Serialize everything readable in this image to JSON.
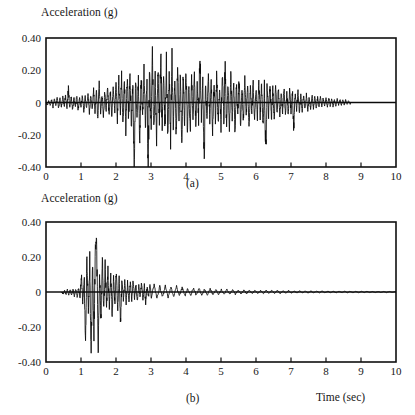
{
  "figure": {
    "name": "earthquake-acceleration-time-histories",
    "x_axis_title": "Time (sec)"
  },
  "chart_data": [
    {
      "id": "a",
      "type": "line",
      "title": "Acceleration (g)",
      "caption": "(a)",
      "xlabel": "",
      "ylabel": "Acceleration (g)",
      "xlim": [
        0,
        10
      ],
      "ylim": [
        -0.4,
        0.4
      ],
      "xticks": [
        "0",
        "1",
        "2",
        "3",
        "4",
        "5",
        "6",
        "7",
        "8",
        "9",
        "10"
      ],
      "xtick_values": [
        0,
        1,
        2,
        3,
        4,
        5,
        6,
        7,
        8,
        9,
        10
      ],
      "yticks": [
        "0.40",
        "0.20",
        "0",
        "-0.20",
        "-0.40"
      ],
      "ytick_values": [
        0.4,
        0.2,
        0,
        -0.2,
        -0.4
      ],
      "grid": false,
      "legend": "none",
      "series_name": "ground acceleration record (a)",
      "peak_positive": 0.33,
      "peak_positive_time": 3.05,
      "peak_negative": -0.4,
      "peak_negative_time": 2.92,
      "record_end_time": 8.7,
      "description": "Broad-band strong motion accelerogram with energetic shaking from about 1.5 s to 7.5 s and a long coda decaying to zero near 8.7 s",
      "x": [
        0.0,
        0.04,
        0.08,
        0.12,
        0.16,
        0.2,
        0.24,
        0.28,
        0.32,
        0.36,
        0.4,
        0.44,
        0.48,
        0.52,
        0.56,
        0.6,
        0.64,
        0.68,
        0.72,
        0.76,
        0.8,
        0.84,
        0.88,
        0.92,
        0.96,
        1.0,
        1.04,
        1.08,
        1.12,
        1.16,
        1.2,
        1.24,
        1.28,
        1.32,
        1.36,
        1.4,
        1.44,
        1.48,
        1.52,
        1.56,
        1.6,
        1.64,
        1.68,
        1.72,
        1.76,
        1.8,
        1.84,
        1.88,
        1.92,
        1.96,
        2.0,
        2.04,
        2.08,
        2.12,
        2.16,
        2.2,
        2.24,
        2.28,
        2.32,
        2.36,
        2.4,
        2.44,
        2.48,
        2.52,
        2.56,
        2.6,
        2.64,
        2.68,
        2.72,
        2.76,
        2.8,
        2.84,
        2.88,
        2.92,
        2.96,
        3.0,
        3.04,
        3.08,
        3.12,
        3.16,
        3.2,
        3.24,
        3.28,
        3.32,
        3.36,
        3.4,
        3.44,
        3.48,
        3.52,
        3.56,
        3.6,
        3.64,
        3.68,
        3.72,
        3.76,
        3.8,
        3.84,
        3.88,
        3.92,
        3.96,
        4.0,
        4.04,
        4.08,
        4.12,
        4.16,
        4.2,
        4.24,
        4.28,
        4.32,
        4.36,
        4.4,
        4.44,
        4.48,
        4.52,
        4.56,
        4.6,
        4.64,
        4.68,
        4.72,
        4.76,
        4.8,
        4.84,
        4.88,
        4.92,
        4.96,
        5.0,
        5.04,
        5.08,
        5.12,
        5.16,
        5.2,
        5.24,
        5.28,
        5.32,
        5.36,
        5.4,
        5.44,
        5.48,
        5.52,
        5.56,
        5.6,
        5.64,
        5.68,
        5.72,
        5.76,
        5.8,
        5.84,
        5.88,
        5.92,
        5.96,
        6.0,
        6.04,
        6.08,
        6.12,
        6.16,
        6.2,
        6.24,
        6.28,
        6.32,
        6.36,
        6.4,
        6.44,
        6.48,
        6.52,
        6.56,
        6.6,
        6.64,
        6.68,
        6.72,
        6.76,
        6.8,
        6.84,
        6.88,
        6.92,
        6.96,
        7.0,
        7.04,
        7.08,
        7.12,
        7.16,
        7.2,
        7.24,
        7.28,
        7.32,
        7.36,
        7.4,
        7.44,
        7.48,
        7.52,
        7.56,
        7.6,
        7.64,
        7.68,
        7.72,
        7.76,
        7.8,
        7.84,
        7.88,
        7.92,
        7.96,
        8.0,
        8.04,
        8.08,
        8.12,
        8.16,
        8.2,
        8.24,
        8.28,
        8.32,
        8.36,
        8.4,
        8.44,
        8.48,
        8.52,
        8.56,
        8.6,
        8.64,
        8.7
      ],
      "y": [
        0.0,
        -0.015,
        0.012,
        -0.022,
        0.018,
        -0.028,
        0.02,
        -0.015,
        0.03,
        -0.035,
        0.025,
        -0.03,
        0.038,
        -0.025,
        0.045,
        -0.04,
        0.085,
        -0.038,
        0.035,
        -0.048,
        0.03,
        -0.032,
        0.042,
        -0.05,
        0.028,
        -0.03,
        0.045,
        -0.055,
        0.035,
        -0.04,
        0.05,
        -0.06,
        0.042,
        -0.038,
        0.075,
        -0.07,
        0.06,
        -0.105,
        0.115,
        -0.06,
        0.055,
        -0.085,
        0.07,
        -0.06,
        0.09,
        -0.075,
        0.065,
        -0.095,
        0.105,
        -0.07,
        0.12,
        -0.1,
        0.145,
        -0.085,
        0.175,
        -0.12,
        0.13,
        -0.18,
        0.155,
        -0.1,
        0.21,
        -0.15,
        0.13,
        -0.375,
        0.165,
        -0.11,
        0.14,
        -0.23,
        0.175,
        -0.125,
        0.205,
        -0.16,
        0.12,
        -0.395,
        0.185,
        -0.15,
        0.335,
        -0.19,
        0.15,
        -0.24,
        0.225,
        -0.13,
        0.29,
        -0.175,
        0.2,
        -0.145,
        0.26,
        -0.21,
        0.18,
        -0.25,
        0.305,
        -0.16,
        0.145,
        -0.195,
        0.225,
        -0.14,
        0.175,
        -0.245,
        0.19,
        -0.12,
        0.215,
        -0.165,
        0.13,
        -0.18,
        0.15,
        -0.11,
        0.165,
        -0.14,
        0.12,
        -0.095,
        0.315,
        -0.09,
        0.135,
        -0.33,
        0.11,
        -0.125,
        0.16,
        -0.1,
        0.145,
        -0.175,
        0.12,
        -0.09,
        0.185,
        -0.13,
        0.105,
        -0.15,
        0.195,
        -0.11,
        0.23,
        -0.14,
        0.12,
        -0.165,
        0.175,
        -0.095,
        0.14,
        -0.185,
        0.115,
        -0.08,
        0.155,
        -0.135,
        0.1,
        -0.11,
        0.145,
        -0.09,
        0.12,
        -0.15,
        0.105,
        -0.075,
        0.13,
        -0.115,
        0.09,
        -0.1,
        0.14,
        -0.085,
        0.11,
        -0.125,
        0.085,
        -0.29,
        0.095,
        -0.07,
        0.12,
        -0.105,
        0.08,
        -0.09,
        0.1,
        -0.065,
        0.085,
        -0.095,
        0.07,
        -0.06,
        0.09,
        -0.08,
        0.065,
        -0.075,
        0.08,
        -0.055,
        0.07,
        -0.17,
        0.06,
        -0.05,
        0.065,
        -0.06,
        0.045,
        -0.055,
        0.055,
        -0.04,
        0.048,
        -0.045,
        0.038,
        -0.042,
        0.045,
        -0.035,
        0.038,
        -0.04,
        0.03,
        -0.032,
        0.035,
        -0.028,
        0.03,
        -0.03,
        0.025,
        -0.026,
        0.028,
        -0.022,
        0.024,
        -0.024,
        0.02,
        -0.02,
        0.022,
        -0.018,
        0.018,
        -0.018,
        0.016,
        -0.015,
        0.015,
        -0.014,
        0.012,
        -0.012,
        0.01,
        -0.01,
        0.008,
        0.0
      ]
    },
    {
      "id": "b",
      "type": "line",
      "title": "Acceleration (g)",
      "caption": "(b)",
      "xlabel": "Time (sec)",
      "ylabel": "Acceleration (g)",
      "xlim": [
        0,
        10
      ],
      "ylim": [
        -0.4,
        0.4
      ],
      "xticks": [
        "0",
        "1",
        "2",
        "3",
        "4",
        "5",
        "6",
        "7",
        "8",
        "9",
        "10"
      ],
      "xtick_values": [
        0,
        1,
        2,
        3,
        4,
        5,
        6,
        7,
        8,
        9,
        10
      ],
      "yticks": [
        "0.40",
        "0.20",
        "0",
        "-0.20",
        "-0.40"
      ],
      "ytick_values": [
        0.4,
        0.2,
        0,
        -0.2,
        -0.4
      ],
      "grid": false,
      "legend": "none",
      "series_name": "ground acceleration record (b)",
      "peak_positive": 0.25,
      "peak_positive_time": 1.45,
      "peak_negative": -0.4,
      "peak_negative_time": 1.27,
      "record_start_time": 0.45,
      "record_end_time": 10.0,
      "description": "Impulsive accelerogram with a short intense burst between about 1.0 s and 2.0 s followed by rapidly decaying low-amplitude motion out to 10 s",
      "x": [
        0.45,
        0.49,
        0.53,
        0.57,
        0.61,
        0.65,
        0.69,
        0.73,
        0.77,
        0.81,
        0.85,
        0.89,
        0.93,
        0.97,
        1.01,
        1.05,
        1.09,
        1.13,
        1.17,
        1.21,
        1.25,
        1.29,
        1.33,
        1.37,
        1.41,
        1.45,
        1.49,
        1.53,
        1.57,
        1.61,
        1.65,
        1.69,
        1.73,
        1.77,
        1.81,
        1.85,
        1.89,
        1.93,
        1.97,
        2.01,
        2.05,
        2.09,
        2.13,
        2.17,
        2.21,
        2.25,
        2.29,
        2.33,
        2.37,
        2.41,
        2.45,
        2.49,
        2.53,
        2.57,
        2.61,
        2.65,
        2.69,
        2.73,
        2.77,
        2.81,
        2.85,
        2.89,
        2.93,
        2.97,
        3.01,
        3.09,
        3.17,
        3.25,
        3.33,
        3.41,
        3.49,
        3.57,
        3.65,
        3.73,
        3.81,
        3.89,
        3.97,
        4.05,
        4.13,
        4.21,
        4.29,
        4.37,
        4.45,
        4.53,
        4.61,
        4.69,
        4.77,
        4.85,
        4.93,
        5.01,
        5.09,
        5.17,
        5.25,
        5.33,
        5.41,
        5.49,
        5.57,
        5.65,
        5.73,
        5.81,
        5.89,
        5.97,
        6.05,
        6.13,
        6.21,
        6.29,
        6.37,
        6.45,
        6.53,
        6.61,
        6.69,
        6.77,
        6.85,
        6.93,
        7.01,
        7.09,
        7.17,
        7.25,
        7.33,
        7.41,
        7.49,
        7.57,
        7.65,
        7.73,
        7.81,
        7.89,
        7.97,
        8.05,
        8.13,
        8.21,
        8.29,
        8.37,
        8.45,
        8.53,
        8.61,
        8.69,
        8.77,
        8.85,
        8.93,
        9.01,
        9.09,
        9.17,
        9.25,
        9.33,
        9.41,
        9.49,
        9.57,
        9.65,
        9.73,
        9.81,
        9.89,
        9.97,
        10.0
      ],
      "y": [
        0.0,
        -0.012,
        0.01,
        -0.015,
        0.014,
        -0.018,
        0.016,
        -0.02,
        0.022,
        -0.025,
        0.02,
        -0.03,
        0.028,
        -0.035,
        0.095,
        -0.055,
        0.06,
        -0.255,
        0.21,
        -0.12,
        0.15,
        -0.4,
        0.165,
        -0.23,
        0.225,
        0.25,
        -0.345,
        0.135,
        -0.155,
        0.18,
        -0.11,
        0.165,
        -0.085,
        0.12,
        -0.1,
        0.09,
        -0.125,
        0.075,
        -0.07,
        0.12,
        -0.095,
        0.06,
        -0.165,
        0.085,
        -0.055,
        0.07,
        -0.06,
        0.05,
        -0.075,
        0.055,
        -0.045,
        0.062,
        -0.04,
        0.048,
        -0.055,
        0.04,
        -0.035,
        0.05,
        -0.038,
        0.03,
        -0.07,
        0.035,
        -0.028,
        0.042,
        -0.03,
        0.038,
        -0.04,
        0.032,
        -0.026,
        0.036,
        -0.03,
        0.025,
        -0.028,
        0.03,
        -0.022,
        0.026,
        -0.024,
        0.02,
        -0.022,
        0.024,
        -0.018,
        0.02,
        -0.02,
        0.016,
        -0.018,
        0.018,
        -0.015,
        0.016,
        -0.016,
        0.014,
        -0.014,
        0.015,
        -0.012,
        0.013,
        -0.013,
        0.012,
        -0.011,
        0.012,
        -0.01,
        0.011,
        -0.01,
        0.01,
        -0.01,
        0.009,
        -0.009,
        0.01,
        -0.008,
        0.009,
        -0.008,
        0.008,
        -0.008,
        0.008,
        -0.007,
        0.008,
        -0.007,
        0.007,
        -0.007,
        0.007,
        -0.006,
        0.007,
        -0.006,
        0.006,
        -0.006,
        0.006,
        -0.005,
        0.006,
        -0.005,
        0.005,
        -0.005,
        0.005,
        -0.005,
        0.005,
        -0.004,
        0.005,
        -0.004,
        0.004,
        -0.004,
        0.004,
        -0.004,
        0.004,
        -0.003,
        0.004,
        -0.003,
        0.003,
        -0.003,
        0.003,
        -0.003,
        0.003,
        -0.003,
        0.003,
        -0.002,
        0.002,
        0.0
      ]
    }
  ]
}
